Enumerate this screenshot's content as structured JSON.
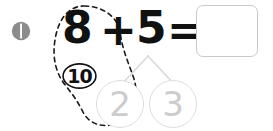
{
  "problem": {
    "number_label": "1",
    "bullet_icon": "numbered-bullet-icon"
  },
  "equation": {
    "addend_one": "8",
    "operator": "+",
    "addend_two": "5",
    "equals": "=",
    "answer_value": "",
    "answer_placeholder": ""
  },
  "make_ten": {
    "group_label": "10",
    "loop_icon": "dashed-grouping-loop-icon",
    "loop_color": "#1a1a1a"
  },
  "number_bond": {
    "connector_icon": "number-bond-branch-icon",
    "connector_color": "#d9d9d9",
    "parts": [
      {
        "value": "2",
        "name": "bond-part-left"
      },
      {
        "value": "3",
        "name": "bond-part-right"
      }
    ]
  },
  "colors": {
    "ink": "#111111",
    "faint_gray": "#cccccc",
    "box_border": "#c9c9c9",
    "bullet_gray": "#8c8c8c"
  }
}
